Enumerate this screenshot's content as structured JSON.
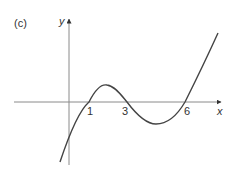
{
  "figure": {
    "panel_label": "(c)",
    "x_axis_label": "x",
    "y_axis_label": "y",
    "roots": [
      {
        "label": "1",
        "x": 1
      },
      {
        "label": "3",
        "x": 3
      },
      {
        "label": "6",
        "x": 6
      }
    ],
    "curve_description": "cubic curve crossing x-axis at 1, 3 and 6",
    "colors": {
      "axis": "#8a8a8a",
      "curve": "#444444",
      "text": "#333333"
    }
  }
}
